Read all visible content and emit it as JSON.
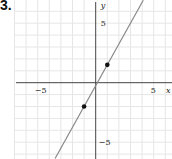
{
  "problem": {
    "number": "3."
  },
  "colors": {
    "grid": "#e6e6e6",
    "axis": "#444444",
    "line": "#888888",
    "point": "#111111"
  },
  "chart_data": {
    "type": "line",
    "title": "",
    "xlabel": "x",
    "ylabel": "y",
    "xlim": [
      -7.3,
      6.5
    ],
    "ylim": [
      -6.4,
      7.0
    ],
    "grid": true,
    "grid_step": 1,
    "x_ticks": [
      {
        "value": -5,
        "label": "−5"
      },
      {
        "value": 5,
        "label": "5"
      }
    ],
    "y_ticks": [
      {
        "value": 5,
        "label": "5"
      },
      {
        "value": -5,
        "label": "−5"
      }
    ],
    "series": [
      {
        "name": "line",
        "kind": "line",
        "slope": 1.75,
        "intercept": -0.25,
        "x": [
          -3.5,
          4.1
        ],
        "y": [
          -6.375,
          6.925
        ]
      },
      {
        "name": "points",
        "kind": "scatter",
        "x": [
          -1,
          1
        ],
        "y": [
          -2,
          1.5
        ]
      }
    ],
    "legend": null
  }
}
